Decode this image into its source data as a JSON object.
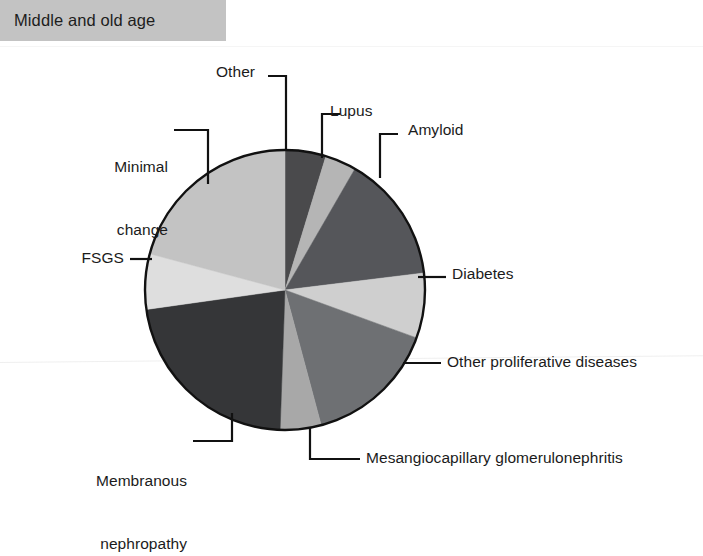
{
  "banner": {
    "title": "Middle and old age"
  },
  "chart_data": {
    "type": "pie",
    "title": "Middle and old age",
    "subtitle": "",
    "xlabel": "",
    "ylabel": "",
    "legend_position": "leader-labels",
    "grid": false,
    "center": {
      "x": 285,
      "y": 290
    },
    "radius": 140,
    "start_angle_deg": 0,
    "direction": "clockwise",
    "categories": [
      "Other",
      "Lupus",
      "Amyloid",
      "Diabetes",
      "Other proliferative diseases",
      "Mesangiocapillary glomerulonephritis",
      "Membranous nephropathy",
      "FSGS",
      "Minimal change"
    ],
    "values": [
      4.7,
      3.6,
      14.7,
      7.5,
      15.3,
      4.7,
      22.2,
      6.4,
      20.9
    ],
    "slices": [
      {
        "label": "Other",
        "value": 4.7,
        "start_deg": 0,
        "end_deg": 17,
        "color": "#4a4a4c"
      },
      {
        "label": "Lupus",
        "value": 3.6,
        "start_deg": 17,
        "end_deg": 30,
        "color": "#b5b5b5"
      },
      {
        "label": "Amyloid",
        "value": 14.7,
        "start_deg": 30,
        "end_deg": 83,
        "color": "#55565a"
      },
      {
        "label": "Diabetes",
        "value": 7.5,
        "start_deg": 83,
        "end_deg": 110,
        "color": "#cfcfcf"
      },
      {
        "label": "Other proliferative diseases",
        "value": 15.3,
        "start_deg": 110,
        "end_deg": 165,
        "color": "#6e7073"
      },
      {
        "label": "Mesangiocapillary glomerulonephritis",
        "value": 4.7,
        "start_deg": 165,
        "end_deg": 182,
        "color": "#a8a8a8"
      },
      {
        "label": "Membranous nephropathy",
        "value": 22.2,
        "start_deg": 182,
        "end_deg": 262,
        "color": "#353638"
      },
      {
        "label": "FSGS",
        "value": 6.4,
        "start_deg": 262,
        "end_deg": 285,
        "color": "#dedede"
      },
      {
        "label": "Minimal change",
        "value": 20.9,
        "start_deg": 285,
        "end_deg": 360,
        "color": "#c3c3c3"
      }
    ],
    "outline_color": "#111111"
  },
  "labels": {
    "other": "Other",
    "lupus": "Lupus",
    "amyloid": "Amyloid",
    "diabetes": "Diabetes",
    "other_proliferative": "Other proliferative diseases",
    "mesangiocapillary": "Mesangiocapillary glomerulonephritis",
    "membranous_line1": "Membranous",
    "membranous_line2": "nephropathy",
    "fsgs": "FSGS",
    "minimal_line1": "Minimal",
    "minimal_line2": "change"
  }
}
